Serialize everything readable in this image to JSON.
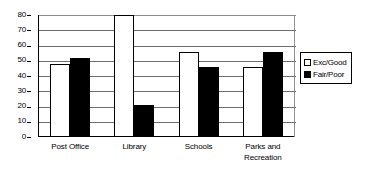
{
  "chart_data": {
    "type": "bar",
    "title": "",
    "xlabel": "",
    "ylabel": "",
    "ylim": [
      0,
      80
    ],
    "yticks": [
      0,
      10,
      20,
      30,
      40,
      50,
      60,
      70,
      80
    ],
    "ytick_labels": [
      "0",
      "10",
      "20",
      "30",
      "40",
      "50",
      "60",
      "70",
      "80"
    ],
    "grid": true,
    "legend_position": "right",
    "categories": [
      "Post Office",
      "Library",
      "Schools",
      "Parks and Recreation"
    ],
    "category_lines": [
      [
        "Post Office"
      ],
      [
        "Library"
      ],
      [
        "Schools"
      ],
      [
        "Parks and",
        "Recreation"
      ]
    ],
    "series": [
      {
        "name": "Exc/Good",
        "color": "#ffffff",
        "edge_color": "#000000",
        "values": [
          48,
          80,
          56,
          46
        ]
      },
      {
        "name": "Fair/Poor",
        "color": "#000000",
        "edge_color": "#000000",
        "values": [
          52,
          21,
          46,
          56
        ]
      }
    ]
  },
  "legend": {
    "items": [
      {
        "label": "Exc/Good",
        "swatch": "hollow-square-icon"
      },
      {
        "label": "Fair/Poor",
        "swatch": "filled-square-icon"
      }
    ]
  }
}
